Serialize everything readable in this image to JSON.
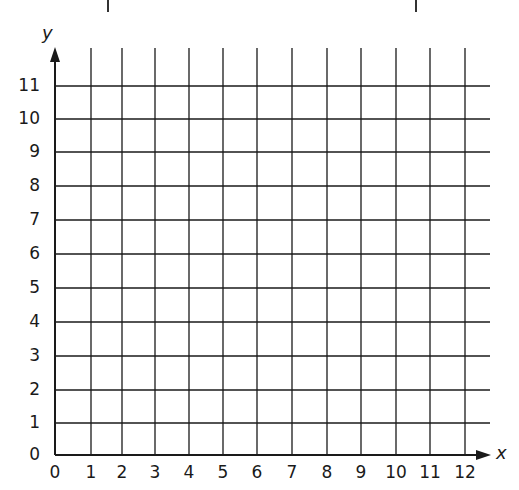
{
  "diagram": {
    "type": "coordinate-grid",
    "x_axis": {
      "name": "x",
      "ticks": [
        "0",
        "1",
        "2",
        "3",
        "4",
        "5",
        "6",
        "7",
        "8",
        "9",
        "10",
        "11",
        "12"
      ],
      "min": 0,
      "max": 12
    },
    "y_axis": {
      "name": "y",
      "ticks": [
        "0",
        "1",
        "2",
        "3",
        "4",
        "5",
        "6",
        "7",
        "8",
        "9",
        "10",
        "11"
      ],
      "min": 0,
      "max": 11
    },
    "grid": true,
    "line_color": "#1a1a1a"
  }
}
